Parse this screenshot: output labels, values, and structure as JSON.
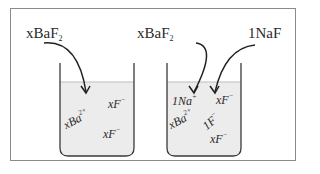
{
  "diagram": {
    "left_beaker": {
      "reagent_label": "xBaF",
      "reagent_subscript": "2",
      "ions": [
        {
          "text": "xF",
          "charge": "−"
        },
        {
          "text": "xBa",
          "charge": "2+"
        },
        {
          "text": "xF",
          "charge": "−"
        }
      ]
    },
    "right_beaker": {
      "reagent_labels": [
        {
          "text": "xBaF",
          "subscript": "2"
        },
        {
          "text": "1NaF",
          "subscript": ""
        }
      ],
      "ions": [
        {
          "text": "1Na",
          "charge": "+"
        },
        {
          "text": "xF",
          "charge": "−"
        },
        {
          "text": "xBa",
          "charge": "2+"
        },
        {
          "text": "1F",
          "charge": "−"
        },
        {
          "text": "xF",
          "charge": "−"
        }
      ]
    },
    "colors": {
      "liquid": "#ececec",
      "outline": "#3a3a3a",
      "frame": "#8a8a8a"
    }
  }
}
